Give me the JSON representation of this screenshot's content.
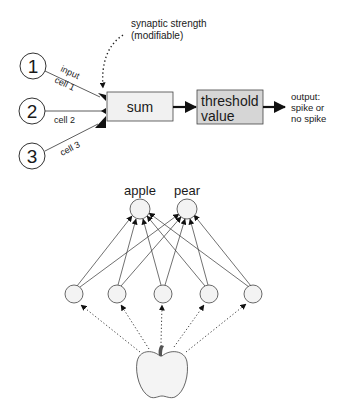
{
  "neuron_model": {
    "inputs": [
      {
        "number": "1",
        "label_line1": "input",
        "label_line2": "cell 1"
      },
      {
        "number": "2",
        "label": "cell 2"
      },
      {
        "number": "3",
        "label": "cell 3"
      }
    ],
    "synapse_annotation": {
      "line1": "synaptic strength",
      "line2": "(modifiable)"
    },
    "sum_box": {
      "label": "sum"
    },
    "threshold_box": {
      "line1": "threshold",
      "line2": "value"
    },
    "output": {
      "line1": "output:",
      "line2": "spike or",
      "line3": "no spike"
    }
  },
  "network": {
    "output_nodes": [
      {
        "label": "apple"
      },
      {
        "label": "pear"
      }
    ],
    "input_node_count": 5,
    "stimulus": "apple-image"
  },
  "colors": {
    "stroke": "#333333",
    "sum_fill": "#f1f1f1",
    "threshold_fill": "#d6d6d6",
    "node_fill": "#f3f3f3"
  }
}
